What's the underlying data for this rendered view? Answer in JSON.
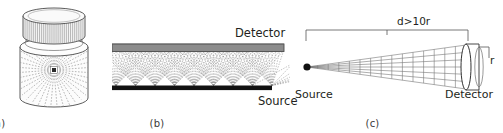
{
  "figure": {
    "background_color": "#ffffff",
    "width": 503,
    "height": 133
  },
  "panels": [
    {
      "id": "a",
      "caption": "(a)",
      "description": "Scintillation vial with knurled cap containing a point source emitting rays isotropically in 4-pi geometry",
      "elements": {
        "cap": "knurled-cylinder-cap",
        "body": "transparent-vial-body",
        "source": "central-point-source",
        "rays": "radial-dashed-rays"
      },
      "colors": {
        "outline": "#4a4a4a",
        "cap_fill": "#f2f2f2",
        "body_fill": "#fbfbfb",
        "ray": "#9a9a9a",
        "source": "#2b2b2b"
      },
      "ray_count": 40
    },
    {
      "id": "b",
      "caption": "(b)",
      "labels": {
        "detector": "Detector",
        "source": "Source"
      },
      "description": "Planar extended source beneath a parallel planar detector with overlapping ray fans",
      "colors": {
        "detector_fill": "#8c8c8c",
        "detector_stroke": "#4a4a4a",
        "source_fill": "#111111",
        "ray": "#8e8e8e"
      },
      "fan_origins": 9,
      "rays_per_fan": 19
    },
    {
      "id": "c",
      "caption": "(c)",
      "labels": {
        "dimension": "d>10r",
        "source": "Source",
        "detector": "Detector",
        "radius": "r"
      },
      "description": "Far-field geometry: point source at distance d from a disc detector of radius r, narrow ray cone subtended",
      "colors": {
        "source_dot": "#111111",
        "ray": "#6f6f6f",
        "detector_stroke": "#333333",
        "detector_fill": "#ffffff",
        "bracket": "#555555"
      },
      "cone_rays": 7
    }
  ],
  "icon_names": [
    "vial-cap-icon",
    "point-source-icon",
    "radial-rays-icon",
    "detector-bar-icon",
    "source-bar-icon",
    "ray-fan-icon",
    "dimension-bracket-icon",
    "disc-detector-icon"
  ]
}
